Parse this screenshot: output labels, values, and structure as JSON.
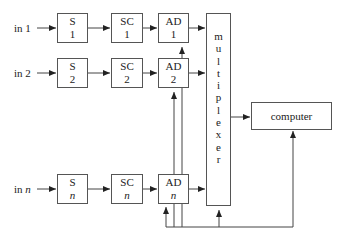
{
  "diagram": {
    "inputs": [
      {
        "prefix": "in ",
        "index": "1"
      },
      {
        "prefix": "in ",
        "index": "2"
      },
      {
        "prefix": "in ",
        "index": "n"
      }
    ],
    "rows": [
      {
        "s": {
          "name": "S",
          "index": "1"
        },
        "sc": {
          "name": "SC",
          "index": "1"
        },
        "ad": {
          "name": "AD",
          "index": "1"
        }
      },
      {
        "s": {
          "name": "S",
          "index": "2"
        },
        "sc": {
          "name": "SC",
          "index": "2"
        },
        "ad": {
          "name": "AD",
          "index": "2"
        }
      },
      {
        "s": {
          "name": "S",
          "index": "n"
        },
        "sc": {
          "name": "SC",
          "index": "n"
        },
        "ad": {
          "name": "AD",
          "index": "n"
        }
      }
    ],
    "multiplexer": {
      "letters": [
        "m",
        "u",
        "l",
        "t",
        "i",
        "p",
        "l",
        "e",
        "x",
        "e",
        "r"
      ]
    },
    "computer": {
      "label": "computer"
    },
    "colors": {
      "line": "#444444",
      "border": "#555555",
      "background": "#ffffff"
    }
  }
}
